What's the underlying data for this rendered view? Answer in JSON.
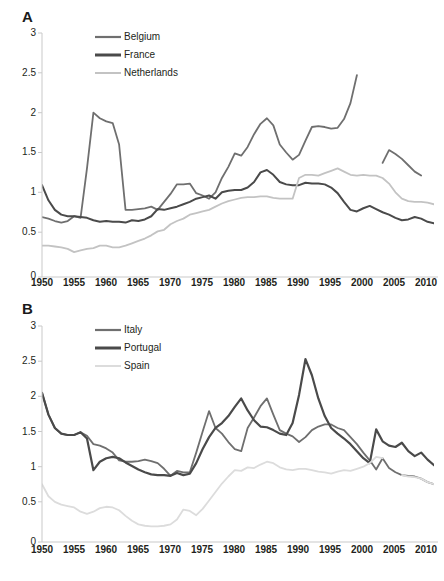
{
  "figure": {
    "background": "#ffffff",
    "panels": [
      "A",
      "B"
    ]
  },
  "panel_a": {
    "label": "A",
    "legend": [
      {
        "name": "Belgium",
        "color": "#6f6f6f",
        "width": 2.0
      },
      {
        "name": "France",
        "color": "#4a4a4a",
        "width": 2.6
      },
      {
        "name": "Netherlands",
        "color": "#c3c3c3",
        "width": 1.8
      }
    ],
    "yticks": [
      "0",
      "0.5",
      "1",
      "1.5",
      "2",
      "2.5",
      "3"
    ],
    "xticks": [
      "1950",
      "1955",
      "1960",
      "1965",
      "1970",
      "1975",
      "1980",
      "1985",
      "1990",
      "1995",
      "2000",
      "2005",
      "2010"
    ]
  },
  "panel_b": {
    "label": "B",
    "legend": [
      {
        "name": "Italy",
        "color": "#6f6f6f",
        "width": 2.0
      },
      {
        "name": "Portugal",
        "color": "#4a4a4a",
        "width": 2.6
      },
      {
        "name": "Spain",
        "color": "#dcdcdc",
        "width": 1.8
      }
    ],
    "yticks": [
      "0",
      "0.5",
      "1",
      "1.5",
      "2",
      "2.5",
      "3"
    ],
    "xticks": [
      "1950",
      "1955",
      "1960",
      "1965",
      "1970",
      "1975",
      "1980",
      "1985",
      "1990",
      "1995",
      "2000",
      "2005",
      "2010"
    ]
  },
  "chart_data": [
    {
      "panel": "A",
      "type": "line",
      "title": "",
      "xlabel": "",
      "ylabel": "",
      "xlim": [
        1950,
        2011
      ],
      "ylim": [
        0,
        3
      ],
      "ytick_values": [
        0,
        0.5,
        1,
        1.5,
        2,
        2.5,
        3
      ],
      "xtick_values": [
        1950,
        1955,
        1960,
        1965,
        1970,
        1975,
        1980,
        1985,
        1990,
        1995,
        2000,
        2005,
        2010
      ],
      "grid": false,
      "legend_position": "top-left-inside",
      "x": [
        1950,
        1951,
        1952,
        1953,
        1954,
        1955,
        1956,
        1957,
        1958,
        1959,
        1960,
        1961,
        1962,
        1963,
        1964,
        1965,
        1966,
        1967,
        1968,
        1969,
        1970,
        1971,
        1972,
        1973,
        1974,
        1975,
        1976,
        1977,
        1978,
        1979,
        1980,
        1981,
        1982,
        1983,
        1984,
        1985,
        1986,
        1987,
        1988,
        1989,
        1990,
        1991,
        1992,
        1993,
        1994,
        1995,
        1996,
        1997,
        1998,
        1999,
        2000,
        2001,
        2002,
        2003,
        2004,
        2005,
        2006,
        2007,
        2008,
        2009,
        2010,
        2011
      ],
      "series": [
        {
          "name": "Belgium",
          "color": "#6f6f6f",
          "values": [
            0.69,
            0.67,
            0.64,
            0.62,
            0.64,
            0.7,
            0.68,
            1.3,
            2.0,
            1.93,
            1.89,
            1.87,
            1.6,
            0.78,
            0.78,
            0.79,
            0.8,
            0.82,
            0.78,
            0.88,
            0.98,
            1.1,
            1.1,
            1.11,
            0.99,
            0.96,
            0.92,
            1.0,
            1.18,
            1.32,
            1.49,
            1.46,
            1.57,
            1.73,
            1.86,
            1.93,
            1.84,
            1.6,
            1.5,
            1.41,
            1.47,
            1.65,
            1.82,
            1.83,
            1.82,
            1.8,
            1.81,
            1.92,
            2.12,
            2.47,
            null,
            null,
            null,
            1.37,
            1.53,
            1.48,
            1.42,
            1.34,
            1.26,
            1.21,
            null,
            null
          ],
          "gaps": [
            [
              1999.5,
              2002.5
            ]
          ]
        },
        {
          "name": "France",
          "color": "#4a4a4a",
          "values": [
            1.09,
            0.9,
            0.78,
            0.72,
            0.7,
            0.7,
            0.69,
            0.68,
            0.65,
            0.63,
            0.64,
            0.63,
            0.63,
            0.62,
            0.65,
            0.64,
            0.66,
            0.7,
            0.79,
            0.78,
            0.8,
            0.82,
            0.85,
            0.88,
            0.92,
            0.94,
            0.96,
            0.92,
            1.0,
            1.02,
            1.03,
            1.03,
            1.06,
            1.13,
            1.25,
            1.28,
            1.22,
            1.13,
            1.1,
            1.09,
            1.09,
            1.12,
            1.11,
            1.11,
            1.1,
            1.06,
            0.99,
            0.88,
            0.78,
            0.76,
            0.8,
            0.83,
            0.79,
            0.75,
            0.72,
            0.68,
            0.65,
            0.66,
            0.69,
            0.67,
            0.63,
            0.61
          ],
          "gaps": []
        },
        {
          "name": "Netherlands",
          "color": "#c3c3c3",
          "values": [
            0.33,
            0.33,
            0.32,
            0.31,
            0.29,
            0.25,
            0.27,
            0.29,
            0.3,
            0.33,
            0.33,
            0.31,
            0.31,
            0.33,
            0.36,
            0.39,
            0.42,
            0.46,
            0.51,
            0.53,
            0.6,
            0.64,
            0.67,
            0.72,
            0.74,
            0.76,
            0.78,
            0.82,
            0.86,
            0.89,
            0.91,
            0.93,
            0.94,
            0.94,
            0.95,
            0.95,
            0.93,
            0.92,
            0.92,
            0.92,
            1.18,
            1.22,
            1.22,
            1.21,
            1.24,
            1.27,
            1.3,
            1.26,
            1.22,
            1.21,
            1.22,
            1.21,
            1.21,
            1.18,
            1.11,
            1.0,
            0.92,
            0.89,
            0.88,
            0.88,
            0.87,
            0.85
          ],
          "gaps": []
        }
      ]
    },
    {
      "panel": "B",
      "type": "line",
      "title": "",
      "xlabel": "",
      "ylabel": "",
      "xlim": [
        1950,
        2011
      ],
      "ylim": [
        0,
        3
      ],
      "ytick_values": [
        0,
        0.5,
        1,
        1.5,
        2,
        2.5,
        3
      ],
      "xtick_values": [
        1950,
        1955,
        1960,
        1965,
        1970,
        1975,
        1980,
        1985,
        1990,
        1995,
        2000,
        2005,
        2010
      ],
      "grid": false,
      "legend_position": "top-left-inside",
      "x": [
        1950,
        1951,
        1952,
        1953,
        1954,
        1955,
        1956,
        1957,
        1958,
        1959,
        1960,
        1961,
        1962,
        1963,
        1964,
        1965,
        1966,
        1967,
        1968,
        1969,
        1970,
        1971,
        1972,
        1973,
        1974,
        1975,
        1976,
        1977,
        1978,
        1979,
        1980,
        1981,
        1982,
        1983,
        1984,
        1985,
        1986,
        1987,
        1988,
        1989,
        1990,
        1991,
        1992,
        1993,
        1994,
        1995,
        1996,
        1997,
        1998,
        1999,
        2000,
        2001,
        2002,
        2003,
        2004,
        2005,
        2006,
        2007,
        2008,
        2009,
        2010,
        2011
      ],
      "series": [
        {
          "name": "Italy",
          "color": "#6f6f6f",
          "values": [
            2.05,
            1.74,
            1.55,
            1.47,
            1.45,
            1.45,
            1.49,
            1.44,
            1.32,
            1.3,
            1.26,
            1.2,
            1.09,
            1.07,
            1.07,
            1.08,
            1.1,
            1.08,
            1.05,
            0.97,
            0.87,
            0.94,
            0.92,
            0.92,
            1.2,
            1.5,
            1.79,
            1.55,
            1.47,
            1.35,
            1.25,
            1.22,
            1.55,
            1.7,
            1.86,
            1.97,
            1.74,
            1.52,
            1.47,
            1.43,
            1.35,
            1.42,
            1.52,
            1.57,
            1.6,
            1.6,
            1.55,
            1.52,
            1.42,
            1.32,
            1.2,
            1.09,
            0.96,
            1.12,
            0.98,
            0.92,
            0.88,
            0.87,
            0.86,
            0.83,
            0.78,
            0.75
          ],
          "gaps": []
        },
        {
          "name": "Portugal",
          "color": "#4a4a4a",
          "values": [
            2.05,
            1.74,
            1.55,
            1.47,
            1.45,
            1.45,
            1.49,
            1.4,
            0.95,
            1.07,
            1.12,
            1.14,
            1.12,
            1.06,
            1.01,
            0.96,
            0.92,
            0.89,
            0.88,
            0.88,
            0.87,
            0.91,
            0.88,
            0.9,
            1.05,
            1.25,
            1.42,
            1.55,
            1.62,
            1.72,
            1.85,
            1.97,
            1.8,
            1.66,
            1.57,
            1.56,
            1.52,
            1.47,
            1.45,
            1.62,
            2.02,
            2.53,
            2.3,
            1.97,
            1.72,
            1.55,
            1.47,
            1.4,
            1.32,
            1.22,
            1.12,
            1.05,
            1.53,
            1.36,
            1.3,
            1.28,
            1.34,
            1.22,
            1.15,
            1.2,
            1.1,
            1.02
          ],
          "gaps": []
        },
        {
          "name": "Spain",
          "color": "#dcdcdc",
          "values": [
            0.75,
            0.58,
            0.5,
            0.46,
            0.44,
            0.42,
            0.36,
            0.33,
            0.36,
            0.41,
            0.43,
            0.42,
            0.38,
            0.3,
            0.23,
            0.18,
            0.16,
            0.15,
            0.15,
            0.16,
            0.18,
            0.25,
            0.39,
            0.37,
            0.31,
            0.4,
            0.52,
            0.64,
            0.76,
            0.86,
            0.95,
            0.94,
            0.99,
            0.98,
            1.03,
            1.07,
            1.05,
            0.99,
            0.96,
            0.95,
            0.97,
            0.97,
            0.95,
            0.93,
            0.92,
            0.9,
            0.93,
            0.95,
            0.94,
            0.97,
            1.0,
            1.05,
            1.14,
            1.12,
            null,
            null,
            0.88,
            0.86,
            0.85,
            0.83,
            0.78,
            0.75
          ],
          "gaps": [
            [
              2003.5,
              2005.5
            ]
          ]
        }
      ]
    }
  ]
}
